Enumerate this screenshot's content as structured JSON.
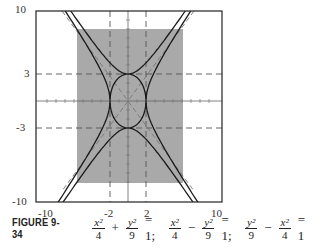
{
  "chart_data": {
    "type": "line",
    "title": "",
    "xlabel": "",
    "ylabel": "",
    "xlim": [
      -10,
      10
    ],
    "ylim": [
      -10,
      10
    ],
    "x_ticks": [
      "-10",
      "-2",
      "2",
      "10"
    ],
    "y_ticks": [
      "10",
      "3",
      "-3",
      "-10"
    ],
    "grid": false,
    "shaded_region": {
      "x": [
        -5.5,
        6
      ],
      "y": [
        -8.5,
        8
      ],
      "color": "#a9a9a9"
    },
    "dashed_reference_lines": {
      "x": [
        -2,
        2
      ],
      "y": [
        -3,
        3
      ]
    },
    "asymptotes": [
      "y = 1.5x",
      "y = -1.5x"
    ],
    "series": [
      {
        "name": "ellipse",
        "equation": "x^2/4 + y^2/9 = 1",
        "shape": "ellipse",
        "a": 2,
        "b": 3
      },
      {
        "name": "hyperbola_x",
        "equation": "x^2/4 - y^2/9 = 1",
        "shape": "hyperbola opening left/right",
        "vertices": [
          [
            -2,
            0
          ],
          [
            2,
            0
          ]
        ]
      },
      {
        "name": "hyperbola_y",
        "equation": "y^2/9 - x^2/4 = 1",
        "shape": "hyperbola opening up/down",
        "vertices": [
          [
            0,
            -3
          ],
          [
            0,
            3
          ]
        ]
      }
    ],
    "legend": null
  },
  "axes": {
    "x_tick_labels": [
      "-10",
      "-2",
      "2",
      "10"
    ],
    "y_tick_labels": [
      "10",
      "3",
      "-3",
      "-10"
    ]
  },
  "caption": {
    "figure_label": "FIGURE 9-34",
    "equations": [
      {
        "terms": [
          {
            "num": "x²",
            "den": "4"
          },
          {
            "op": "+"
          },
          {
            "num": "y²",
            "den": "9"
          }
        ],
        "rhs": "= 1;"
      },
      {
        "terms": [
          {
            "num": "x²",
            "den": "4"
          },
          {
            "op": "−"
          },
          {
            "num": "y²",
            "den": "9"
          }
        ],
        "rhs": "= 1;"
      },
      {
        "terms": [
          {
            "num": "y²",
            "den": "9"
          },
          {
            "op": "−"
          },
          {
            "num": "x²",
            "den": "4"
          }
        ],
        "rhs": "= 1"
      }
    ]
  },
  "colors": {
    "frame": "#222222",
    "curve": "#1a1a1a",
    "shade": "#a9a9a9",
    "dashed": "#555555",
    "axis": "#666666"
  }
}
